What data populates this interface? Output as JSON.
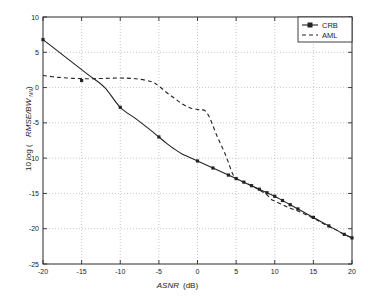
{
  "figure": {
    "background_color": "#ffffff",
    "foreground_color": "#232323",
    "grid_color": "#8c8c8c"
  },
  "chart_data": {
    "type": "line",
    "title": "",
    "xlabel": "ASNR  (dB)",
    "xlabel_main": "ASNR",
    "xlabel_units": "(dB)",
    "ylabel": "10 log (RMSE/BW_NN)",
    "ylabel_prefix": "10 log (",
    "ylabel_italic": "RMSE/BW",
    "ylabel_subscript": "NN",
    "ylabel_suffix": ")",
    "xlim": [
      -20,
      20
    ],
    "ylim": [
      -25,
      10
    ],
    "xticks": [
      -20,
      -15,
      -10,
      -5,
      0,
      5,
      10,
      15,
      20
    ],
    "yticks": [
      -25,
      -20,
      -15,
      -10,
      -5,
      0,
      5,
      10
    ],
    "xtick_labels": [
      "-20",
      "-15",
      "-10",
      "-5",
      "0",
      "5",
      "10",
      "15",
      "20"
    ],
    "ytick_labels": [
      "-25",
      "-20",
      "-15",
      "-10",
      "-5",
      "0",
      "5",
      "10"
    ],
    "grid": true,
    "grid_style": "dotted",
    "legend_position": "upper-right",
    "legend": [
      "CRB",
      "AML"
    ],
    "series": [
      {
        "name": "CRB",
        "style": "solid",
        "marker": "square",
        "x": [
          -20,
          -18,
          -16,
          -14,
          -12,
          -10,
          -8,
          -6,
          -5,
          -4,
          -3,
          -2,
          -1,
          0,
          1,
          2,
          3,
          4,
          5,
          6,
          7,
          8,
          9,
          10,
          11,
          12,
          13,
          14,
          15,
          16,
          17,
          18,
          19,
          20
        ],
        "y": [
          6.8,
          5.1,
          3.4,
          1.7,
          0.0,
          -2.8,
          -4.4,
          -6.1,
          -7.0,
          -7.9,
          -8.7,
          -9.4,
          -9.9,
          -10.4,
          -10.9,
          -11.4,
          -11.9,
          -12.4,
          -12.9,
          -13.4,
          -13.9,
          -14.4,
          -14.9,
          -15.4,
          -16.0,
          -16.6,
          -17.2,
          -17.8,
          -18.4,
          -19.0,
          -19.6,
          -20.2,
          -20.8,
          -21.3
        ],
        "marker_x": [
          -20,
          -15,
          -10,
          -5,
          0,
          2,
          4,
          5,
          6,
          7,
          8,
          9,
          10,
          11,
          12,
          13,
          15,
          17,
          19,
          20
        ],
        "marker_y": [
          6.8,
          1.0,
          -2.8,
          -7.0,
          -10.4,
          -11.4,
          -12.4,
          -12.9,
          -13.4,
          -13.9,
          -14.4,
          -14.9,
          -15.4,
          -16.0,
          -16.6,
          -17.2,
          -18.4,
          -19.6,
          -20.8,
          -21.3
        ]
      },
      {
        "name": "AML",
        "style": "dashed",
        "marker": "none",
        "x": [
          -20,
          -18,
          -16,
          -14,
          -12,
          -10,
          -8,
          -6,
          -5,
          -4,
          -3,
          -2,
          -1,
          0,
          0.5,
          1,
          1.5,
          2,
          2.5,
          3,
          3.5,
          4,
          4.5,
          5,
          6,
          7,
          8,
          9,
          9.5,
          10,
          11,
          12,
          13,
          14,
          15,
          16,
          17,
          18,
          19,
          20
        ],
        "y": [
          1.7,
          1.45,
          1.3,
          1.25,
          1.3,
          1.35,
          1.25,
          0.85,
          0.2,
          -0.7,
          -1.5,
          -2.3,
          -2.85,
          -3.1,
          -3.15,
          -3.3,
          -4.1,
          -5.4,
          -6.8,
          -8.0,
          -9.2,
          -10.6,
          -12.1,
          -12.9,
          -13.4,
          -13.9,
          -14.5,
          -15.2,
          -15.8,
          -16.1,
          -16.6,
          -17.1,
          -17.5,
          -18.0,
          -18.5,
          -19.1,
          -19.7,
          -20.2,
          -20.8,
          -21.3
        ]
      }
    ]
  },
  "axes_geometry": {
    "left": 43,
    "right": 352,
    "top": 17,
    "bottom": 264
  },
  "legend_geometry": {
    "x": 298,
    "y": 17,
    "width": 54,
    "height": 25
  }
}
